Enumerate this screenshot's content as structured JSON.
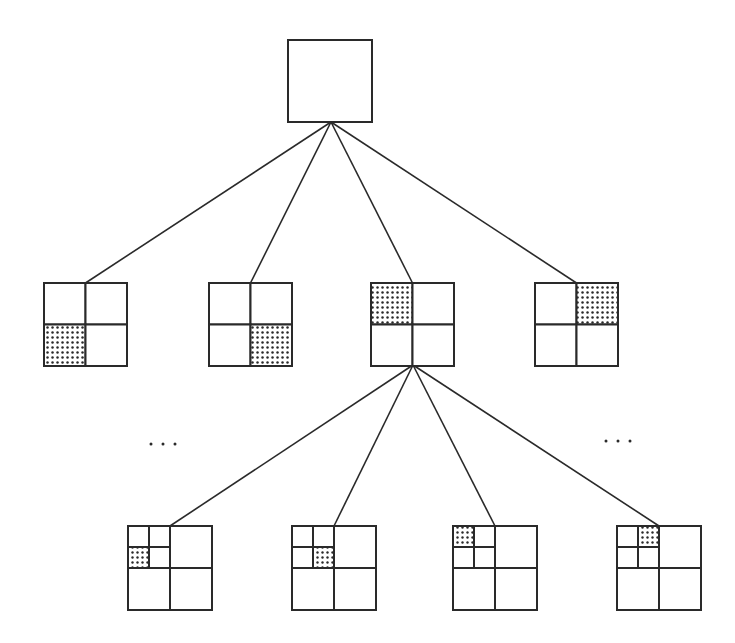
{
  "diagram": {
    "type": "quadtree",
    "colors": {
      "stroke": "#2a2a2a",
      "background": "#ffffff",
      "dot": "#2a2a2a"
    },
    "root": {
      "x": 288,
      "y": 40,
      "size": 84
    },
    "level1": {
      "apex": {
        "x": 331,
        "y": 122
      },
      "nodes": [
        {
          "id": "L1-0",
          "x": 44,
          "y": 283,
          "size": 83,
          "shaded": "bottom-left"
        },
        {
          "id": "L1-1",
          "x": 209,
          "y": 283,
          "size": 83,
          "shaded": "bottom-right"
        },
        {
          "id": "L1-2",
          "x": 371,
          "y": 283,
          "size": 83,
          "shaded": "top-left",
          "expanded": true
        },
        {
          "id": "L1-3",
          "x": 535,
          "y": 283,
          "size": 83,
          "shaded": "top-right"
        }
      ]
    },
    "level2": {
      "parent": "L1-2",
      "apex": {
        "x": 413,
        "y": 365
      },
      "nodes": [
        {
          "id": "L2-0",
          "x": 128,
          "y": 526,
          "size": 84,
          "shaded": "top-left/bottom-left"
        },
        {
          "id": "L2-1",
          "x": 292,
          "y": 526,
          "size": 84,
          "shaded": "top-left/bottom-right"
        },
        {
          "id": "L2-2",
          "x": 453,
          "y": 526,
          "size": 84,
          "shaded": "top-left/top-left"
        },
        {
          "id": "L2-3",
          "x": 617,
          "y": 526,
          "size": 84,
          "shaded": "top-left/top-right"
        }
      ]
    },
    "ellipses": [
      {
        "label": "...",
        "x": 163,
        "y": 444
      },
      {
        "label": "...",
        "x": 618,
        "y": 441
      }
    ]
  }
}
